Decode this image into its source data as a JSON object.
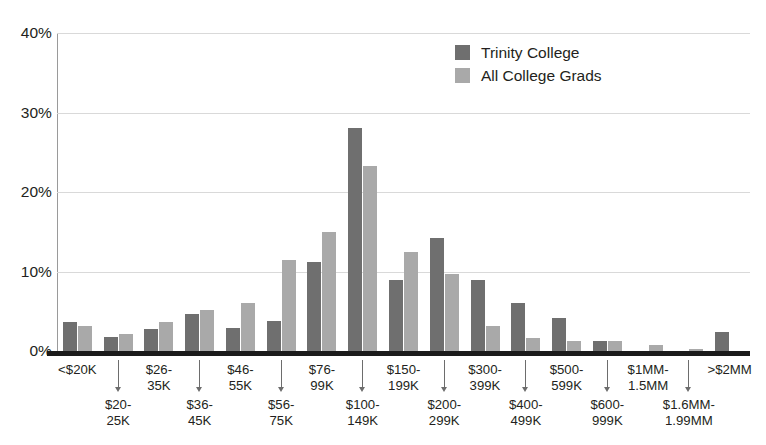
{
  "chart_data": {
    "type": "bar",
    "title": "",
    "subtitle": "",
    "xlabel": "",
    "ylabel": "",
    "ylim": [
      0,
      40
    ],
    "y_ticks": [
      "0%",
      "10%",
      "20%",
      "30%",
      "40%"
    ],
    "y_tick_values": [
      0,
      10,
      20,
      30,
      40
    ],
    "grid": true,
    "legend_position": "top-center-right",
    "categories": [
      "<$20K",
      "$20-\n25K",
      "$26-\n35K",
      "$36-\n45K",
      "$46-\n55K",
      "$56-\n75K",
      "$76-\n99K",
      "$100-\n149K",
      "$150-\n199K",
      "$200-\n299K",
      "$300-\n399K",
      "$400-\n499K",
      "$500-\n599K",
      "$600-\n999K",
      "$1MM-\n1.5MM",
      "$1.6MM-\n1.99MM",
      ">$2MM"
    ],
    "series": [
      {
        "name": "Trinity College",
        "color": "#6f6f6f",
        "values": [
          3.6,
          1.8,
          2.8,
          4.7,
          2.9,
          3.8,
          11.2,
          28.0,
          8.9,
          14.2,
          8.9,
          6.0,
          4.2,
          1.2,
          0.0,
          0.0,
          2.4
        ]
      },
      {
        "name": "All College Grads",
        "color": "#a9a9a9",
        "values": [
          3.1,
          2.1,
          3.6,
          5.1,
          6.1,
          11.5,
          15.0,
          23.3,
          12.5,
          9.7,
          3.2,
          1.7,
          1.3,
          1.2,
          0.8,
          0.3,
          0.0
        ]
      }
    ]
  },
  "legend": {
    "items": [
      {
        "label": "Trinity College",
        "color": "#6f6f6f"
      },
      {
        "label": "All College Grads",
        "color": "#a9a9a9"
      }
    ]
  },
  "axis": {
    "y_ticks": [
      "40%",
      "30%",
      "20%",
      "10%",
      "0%"
    ]
  },
  "colors": {
    "trinity": "#6f6f6f",
    "all_grads": "#a9a9a9",
    "gridline": "#d9d9d9",
    "baseline": "#1b1b1b",
    "text": "#231f20",
    "arrow": "#6d6d6d"
  }
}
